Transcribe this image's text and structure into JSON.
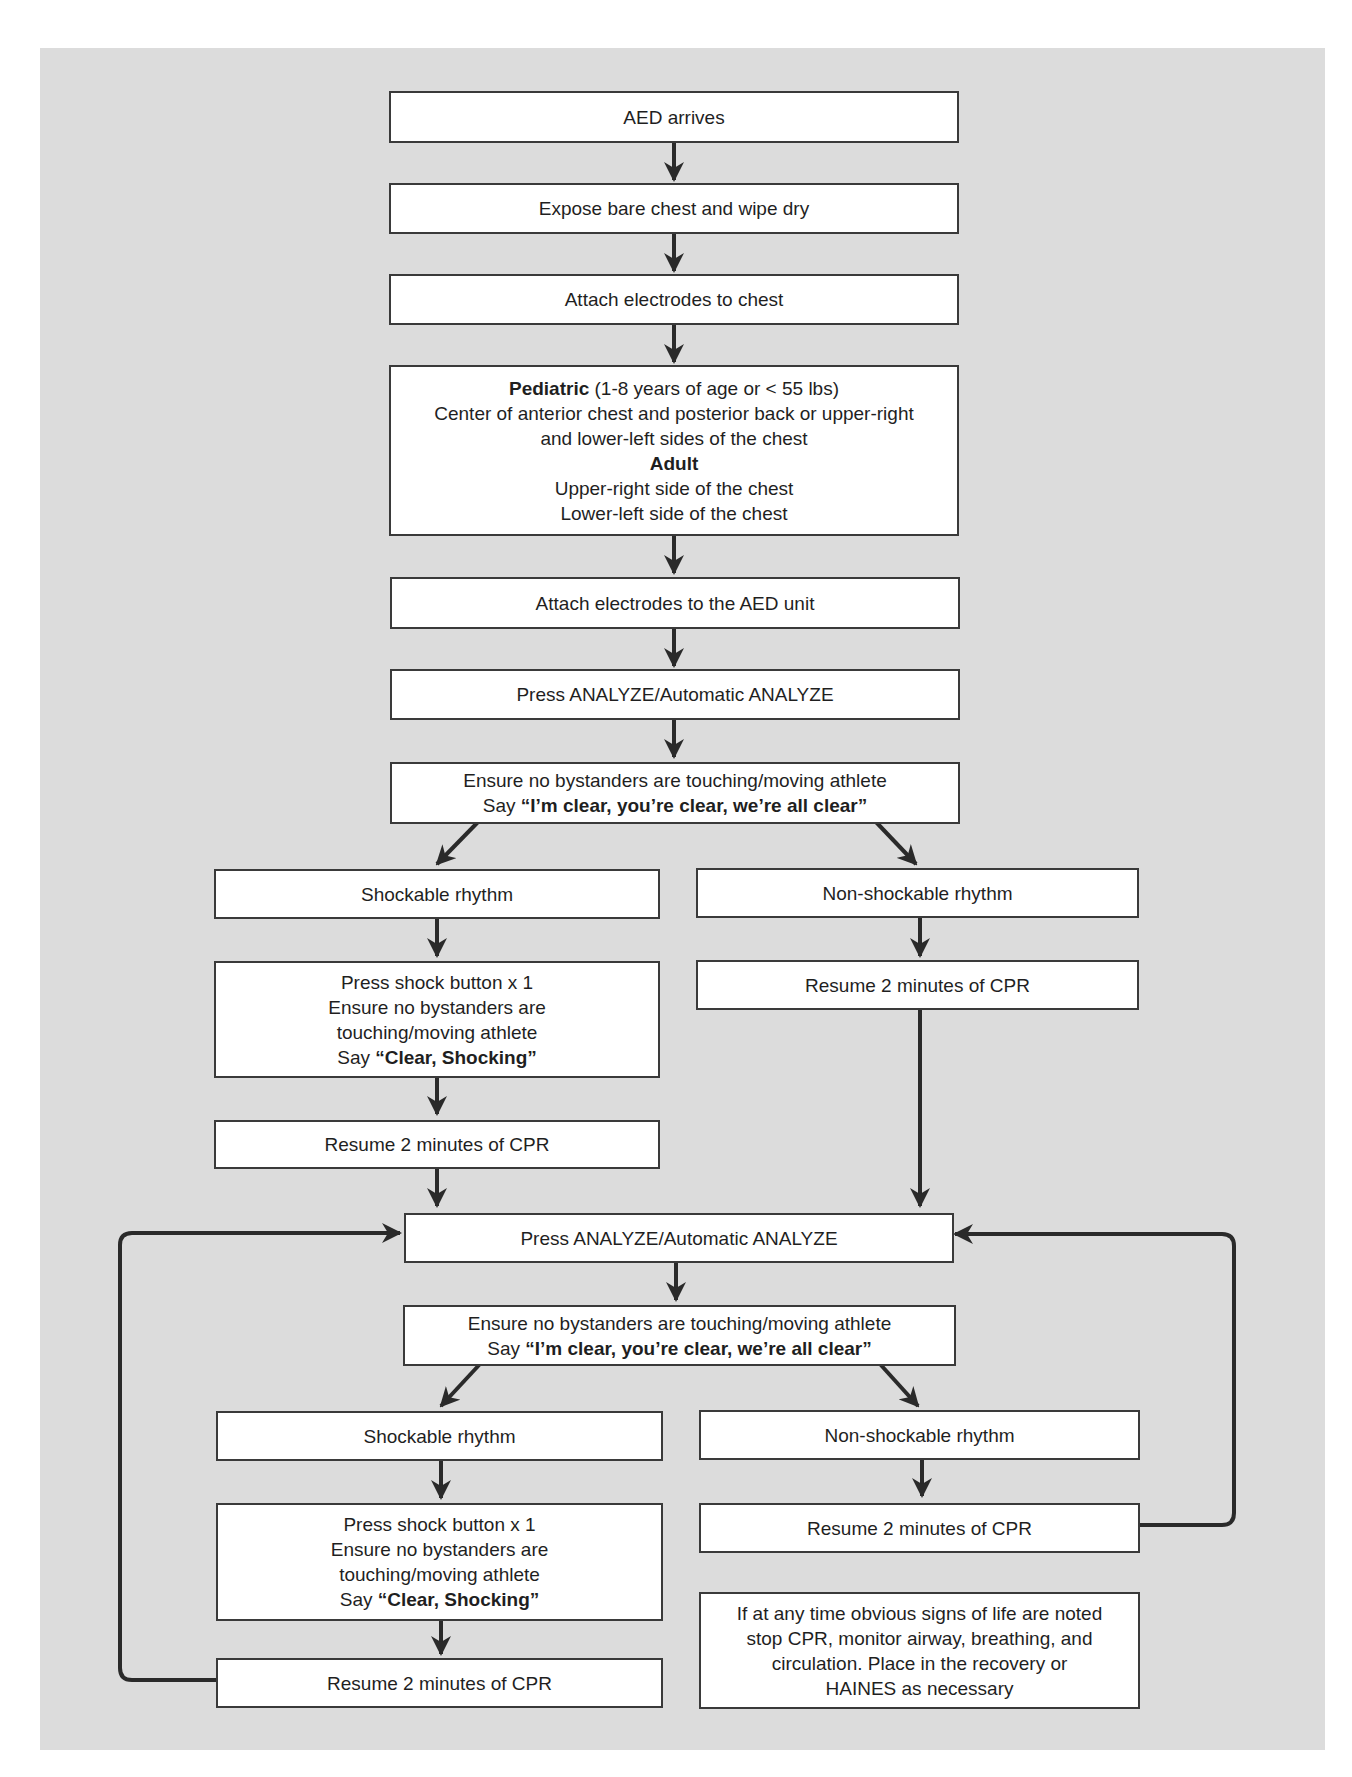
{
  "diagram": {
    "type": "flowchart",
    "background_color": "#dcdcdc",
    "box_color": "#ffffff",
    "line_color": "#2a2a2a"
  },
  "steps": {
    "aed_arrives": "AED arrives",
    "expose_chest": "Expose bare chest and wipe dry",
    "attach_electrodes_chest": "Attach electrodes to chest",
    "placement": {
      "pediatric_label": "Pediatric",
      "pediatric_criteria": " (1-8 years of age or < 55 lbs)",
      "pediatric_line2": "Center of anterior chest and posterior back or upper-right",
      "pediatric_line3": "and lower-left sides of the chest",
      "adult_label": "Adult",
      "adult_line1": "Upper-right side of the chest",
      "adult_line2": "Lower-left side of the chest"
    },
    "attach_electrodes_unit": "Attach electrodes to the AED unit",
    "analyze_1": "Press ANALYZE/Automatic ANALYZE",
    "clear_1": {
      "line1": "Ensure no bystanders are touching/moving athlete",
      "say": "Say ",
      "quote": "“I’m clear, you’re clear, we’re all clear”"
    },
    "shockable_1": "Shockable rhythm",
    "non_shockable_1": "Non-shockable rhythm",
    "shock_1": {
      "line1": "Press shock button x 1",
      "line2": "Ensure no bystanders are",
      "line3": "touching/moving athlete",
      "say": "Say ",
      "quote": "“Clear, Shocking”"
    },
    "cpr_shock_1": "Resume 2 minutes of CPR",
    "cpr_non_shock_1": "Resume 2 minutes of CPR",
    "analyze_2": "Press ANALYZE/Automatic ANALYZE",
    "clear_2": {
      "line1": "Ensure no bystanders are touching/moving athlete",
      "say": "Say ",
      "quote": "“I’m clear, you’re clear, we’re all clear”"
    },
    "shockable_2": "Shockable rhythm",
    "non_shockable_2": "Non-shockable rhythm",
    "shock_2": {
      "line1": "Press shock button x 1",
      "line2": "Ensure no bystanders are",
      "line3": "touching/moving athlete",
      "say": "Say ",
      "quote": "“Clear, Shocking”"
    },
    "cpr_shock_2": "Resume 2 minutes of CPR",
    "cpr_non_shock_2": "Resume 2 minutes of CPR",
    "note": {
      "line1": "If at any time obvious signs of life are noted",
      "line2": "stop CPR, monitor airway, breathing, and",
      "line3": "circulation. Place in the recovery or",
      "line4": "HAINES as necessary"
    }
  }
}
